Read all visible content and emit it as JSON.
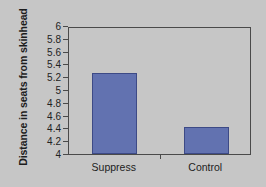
{
  "chart_data": {
    "type": "bar",
    "title": "",
    "subtitle": "",
    "xlabel": "",
    "ylabel": "Distance in seats from skinhead",
    "categories": [
      "Suppress",
      "Control"
    ],
    "values": [
      5.27,
      4.42
    ],
    "series": [
      {
        "name": "Distance in seats from skinhead",
        "values": [
          5.27,
          4.42
        ]
      }
    ],
    "ylim": [
      4,
      6
    ],
    "ytick_labels": [
      "4",
      "4.2",
      "4.4",
      "4.6",
      "4.8",
      "5",
      "5.2",
      "5.4",
      "5.6",
      "5.8",
      "6"
    ],
    "ytick_values": [
      4,
      4.2,
      4.4,
      4.6,
      4.8,
      5,
      5.2,
      5.4,
      5.6,
      5.8,
      6
    ],
    "grid": false,
    "legend": false,
    "legend_position": "none",
    "annotations": []
  },
  "style": {
    "background_color": "#c6c6c6",
    "bar_color": "#6272b0",
    "bar_border_color": "#3d4a86",
    "axis_color": "#4a4a4a",
    "text_color": "#1d1d1d"
  }
}
